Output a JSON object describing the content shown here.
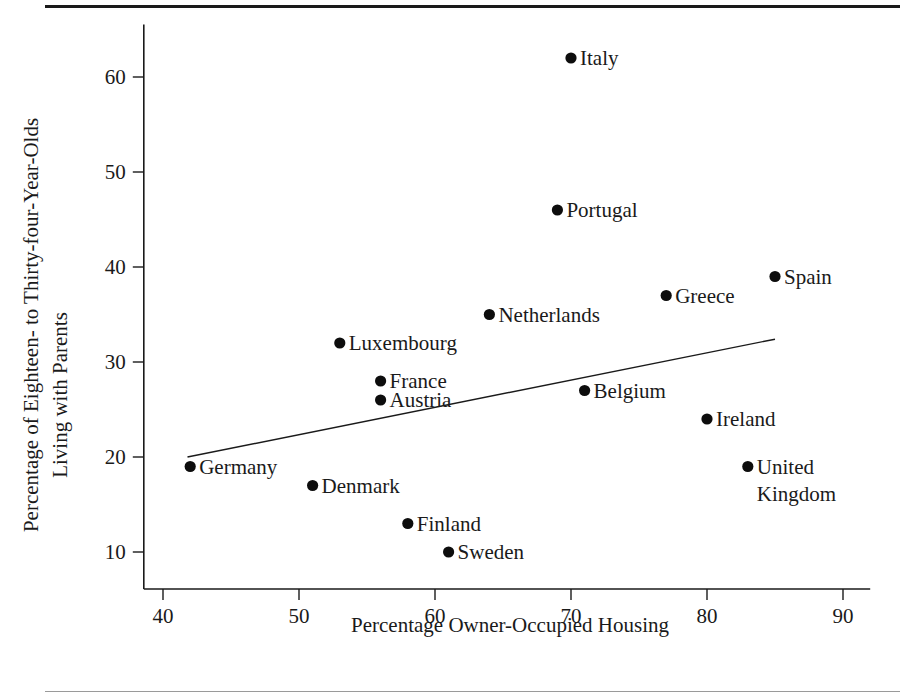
{
  "figure": {
    "kind": "scatter-plot",
    "background_color": "#ffffff",
    "ink_color": "#1a1a1a",
    "top_rule_color": "#1a1a1a",
    "bottom_rule_color": "#9a9a9a"
  },
  "chart_data": {
    "type": "scatter",
    "title": "",
    "xlabel": "Percentage Owner-Occupied Housing",
    "ylabel": "Percentage of Eighteen- to Thirty-four-Year-Olds Living with Parents",
    "ylabel_line1": "Percentage of Eighteen- to Thirty-four-Year-Olds",
    "ylabel_line2": "Living with Parents",
    "xlim": [
      38,
      92
    ],
    "ylim": [
      8,
      65
    ],
    "xticks": [
      40,
      50,
      60,
      70,
      80,
      90
    ],
    "yticks": [
      10,
      20,
      30,
      40,
      50,
      60
    ],
    "xtick_labels": [
      "40",
      "50",
      "60",
      "70",
      "80",
      "90"
    ],
    "ytick_labels": [
      "10",
      "20",
      "30",
      "40",
      "50",
      "60"
    ],
    "grid": false,
    "legend": "none",
    "marker": "filled-circle",
    "marker_color": "#0d0d0d",
    "points": [
      {
        "label": "Italy",
        "x": 70,
        "y": 62,
        "label_side": "right"
      },
      {
        "label": "Portugal",
        "x": 69,
        "y": 46,
        "label_side": "right"
      },
      {
        "label": "Spain",
        "x": 85,
        "y": 39,
        "label_side": "right"
      },
      {
        "label": "Greece",
        "x": 77,
        "y": 37,
        "label_side": "right"
      },
      {
        "label": "Netherlands",
        "x": 64,
        "y": 35,
        "label_side": "right"
      },
      {
        "label": "Luxembourg",
        "x": 53,
        "y": 32,
        "label_side": "right"
      },
      {
        "label": "France",
        "x": 56,
        "y": 28,
        "label_side": "right"
      },
      {
        "label": "Belgium",
        "x": 71,
        "y": 27,
        "label_side": "right"
      },
      {
        "label": "Austria",
        "x": 56,
        "y": 26,
        "label_side": "right"
      },
      {
        "label": "Ireland",
        "x": 80,
        "y": 24,
        "label_side": "right"
      },
      {
        "label": "Germany",
        "x": 42,
        "y": 19,
        "label_side": "right"
      },
      {
        "label": "United Kingdom",
        "x": 83,
        "y": 19,
        "label_side": "right",
        "label_lines": [
          "United",
          "Kingdom"
        ]
      },
      {
        "label": "Denmark",
        "x": 51,
        "y": 17,
        "label_side": "right"
      },
      {
        "label": "Finland",
        "x": 58,
        "y": 13,
        "label_side": "right"
      },
      {
        "label": "Sweden",
        "x": 61,
        "y": 10,
        "label_side": "right"
      }
    ],
    "trend_line": {
      "description": "fitted regression line",
      "x_start": 41.8,
      "y_start": 20.0,
      "x_end": 85.0,
      "y_end": 32.4
    }
  }
}
